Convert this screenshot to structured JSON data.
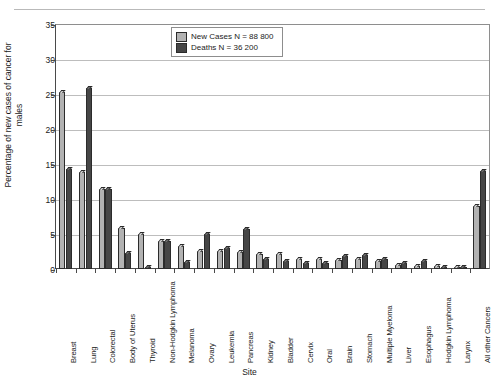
{
  "page": {
    "caption_sliver": "",
    "background": "#ffffff"
  },
  "colors": {
    "new_cases": "#b2b2b2",
    "deaths": "#464646",
    "axis": "#4a4a4a",
    "grid": "#bdbdbd"
  },
  "chart_data": {
    "type": "bar",
    "title": "",
    "xlabel": "Site",
    "ylabel": "Percentage of new cases of cancer for males",
    "ylim": [
      0,
      35
    ],
    "yticks": [
      0,
      5,
      10,
      15,
      20,
      25,
      30,
      35
    ],
    "grid": true,
    "legend_position": "top-center",
    "categories": [
      "Breast",
      "Lung",
      "Colorectal",
      "Body of Uterus",
      "Thyroid",
      "Non-Hodgkin Lymphoma",
      "Melanoma",
      "Ovary",
      "Leukemia",
      "Pancreas",
      "Kidney",
      "Bladder",
      "Cervix",
      "Oral",
      "Brain",
      "Stomach",
      "Multiple Myeloma",
      "Liver",
      "Esophagus",
      "Hodgkin Lymphoma",
      "Larynx",
      "All other Cancers"
    ],
    "series": [
      {
        "name": "New Cases N = 88 800",
        "color": "#b2b2b2",
        "values": [
          25.3,
          13.8,
          11.5,
          5.8,
          5.0,
          4.0,
          3.3,
          2.6,
          2.6,
          2.5,
          2.2,
          2.1,
          1.4,
          1.4,
          1.3,
          1.4,
          1.2,
          0.6,
          0.5,
          0.5,
          0.3,
          9.0
        ]
      },
      {
        "name": "Deaths N = 36 200",
        "color": "#464646",
        "values": [
          14.3,
          25.8,
          11.5,
          2.3,
          0.3,
          4.0,
          1.0,
          5.0,
          3.0,
          5.7,
          1.4,
          1.2,
          0.9,
          0.8,
          1.9,
          2.0,
          1.5,
          0.9,
          1.1,
          0.2,
          0.2,
          14.0
        ]
      }
    ]
  },
  "legend": {
    "items": [
      {
        "label": "New Cases N = 88 800",
        "swatch": "light"
      },
      {
        "label": "Deaths N = 36 200",
        "swatch": "dark"
      }
    ]
  }
}
